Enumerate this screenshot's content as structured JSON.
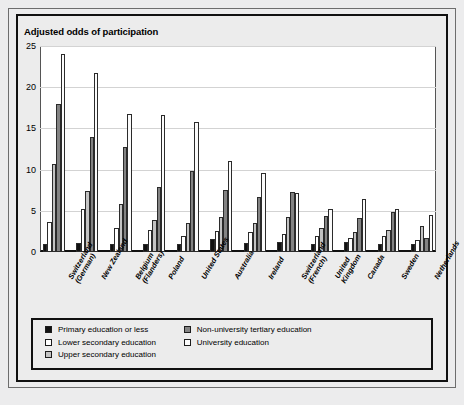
{
  "chart_data": {
    "type": "bar",
    "title": "Adjusted odds of participation",
    "xlabel": "",
    "ylabel": "",
    "ylim": [
      0,
      25
    ],
    "yticks": [
      0,
      5,
      10,
      15,
      20,
      25
    ],
    "grid": true,
    "legend_position": "bottom",
    "categories": [
      "Switzerland\n(German)",
      "New Zealand",
      "Belgium\n(Flanders)",
      "Poland",
      "United States",
      "Australia",
      "Ireland",
      "Switzerland\n(French)",
      "United\nKingdom",
      "Canada",
      "Sweden",
      "Netherlands"
    ],
    "series": [
      {
        "name": "Primary education or less",
        "color": "#111111",
        "values": [
          1.0,
          1.1,
          1.0,
          1.0,
          1.0,
          1.6,
          1.1,
          1.2,
          1.0,
          1.2,
          1.0,
          1.0
        ]
      },
      {
        "name": "Lower secondary education",
        "color": "#ffffff",
        "values": [
          3.7,
          5.2,
          2.9,
          2.7,
          1.9,
          2.6,
          2.4,
          2.2,
          2.0,
          1.7,
          1.9,
          1.5
        ]
      },
      {
        "name": "Upper secondary education",
        "color": "#c3c3c3",
        "values": [
          10.7,
          7.4,
          5.8,
          3.9,
          3.5,
          4.2,
          3.5,
          4.2,
          2.9,
          2.4,
          2.7,
          3.2
        ]
      },
      {
        "name": "Non-university tertiary education",
        "color": "#838383",
        "values": [
          18.0,
          14.0,
          12.8,
          7.9,
          9.8,
          7.5,
          6.7,
          7.3,
          4.4,
          4.1,
          4.9,
          1.7
        ]
      },
      {
        "name": "University education",
        "color": "#fbfbfb",
        "values": [
          24.0,
          21.7,
          16.7,
          16.6,
          15.8,
          11.1,
          9.6,
          7.2,
          5.2,
          6.4,
          5.2,
          4.5
        ]
      }
    ]
  },
  "legend": {
    "items": [
      {
        "label": "Primary education or less",
        "swatch": "#111111"
      },
      {
        "label": "Lower secondary education",
        "swatch": "#ffffff"
      },
      {
        "label": "Upper secondary education",
        "swatch": "#c3c3c3"
      },
      {
        "label": "Non-university tertiary education",
        "swatch": "#838383"
      },
      {
        "label": "University education",
        "swatch": "#fbfbfb"
      }
    ]
  }
}
